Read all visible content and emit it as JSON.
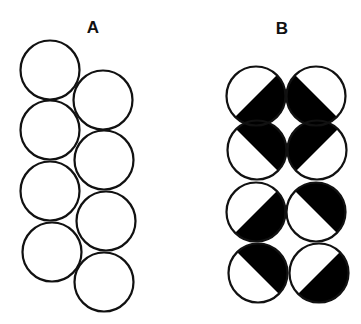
{
  "figure": {
    "panels": [
      {
        "label": "A",
        "label_pos": [
          93,
          33
        ],
        "description": "Eight open circles in two offset columns",
        "circles": [
          {
            "cx": 50,
            "cy": 70,
            "fill": "none"
          },
          {
            "cx": 50,
            "cy": 130,
            "fill": "none"
          },
          {
            "cx": 50,
            "cy": 191,
            "fill": "none"
          },
          {
            "cx": 52,
            "cy": 252,
            "fill": "none"
          },
          {
            "cx": 103,
            "cy": 100,
            "fill": "none"
          },
          {
            "cx": 104,
            "cy": 160,
            "fill": "none"
          },
          {
            "cx": 106,
            "cy": 221,
            "fill": "none"
          },
          {
            "cx": 104,
            "cy": 282,
            "fill": "none"
          }
        ]
      },
      {
        "label": "B",
        "label_pos": [
          282,
          34
        ],
        "description": "Eight circles in a 2x4 grid, each half filled black along a diagonal",
        "circles": [
          {
            "cx": 256,
            "cy": 96,
            "black_half": "lower-right"
          },
          {
            "cx": 316,
            "cy": 96,
            "black_half": "lower-left"
          },
          {
            "cx": 257,
            "cy": 150,
            "black_half": "upper-right"
          },
          {
            "cx": 317,
            "cy": 150,
            "black_half": "upper-left"
          },
          {
            "cx": 256,
            "cy": 212,
            "black_half": "lower-right"
          },
          {
            "cx": 316,
            "cy": 212,
            "black_half": "upper-right"
          },
          {
            "cx": 258,
            "cy": 273,
            "black_half": "upper-right"
          },
          {
            "cx": 319,
            "cy": 273,
            "black_half": "lower-right"
          }
        ]
      }
    ],
    "style": {
      "radius": 29.5,
      "stroke": "#111111",
      "fill_dark": "#000000",
      "stroke_width": 2.2
    }
  }
}
